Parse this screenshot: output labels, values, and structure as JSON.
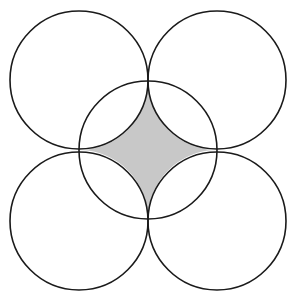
{
  "diagram": {
    "colors": {
      "stroke": "#1a1a1a",
      "shade": "#c8c8c8",
      "background": "#ffffff"
    },
    "radius": 69,
    "circles": [
      {
        "name": "top-left",
        "cx": 79,
        "cy": 80
      },
      {
        "name": "top-right",
        "cx": 217,
        "cy": 80
      },
      {
        "name": "bottom-left",
        "cx": 79,
        "cy": 221
      },
      {
        "name": "bottom-right",
        "cx": 217,
        "cy": 221
      },
      {
        "name": "center",
        "cx": 148,
        "cy": 150
      }
    ]
  }
}
